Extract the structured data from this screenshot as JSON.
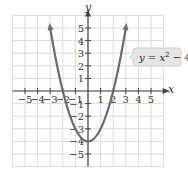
{
  "chart_data": {
    "type": "line",
    "title": "",
    "function": "y = x^2 - 4",
    "xlabel": "x",
    "ylabel": "y",
    "xlim": [
      -6,
      6
    ],
    "ylim": [
      -6,
      6
    ],
    "grid": true,
    "x_ticks": [
      -5,
      -4,
      -3,
      -2,
      -1,
      1,
      2,
      3,
      4,
      5
    ],
    "y_ticks": [
      5,
      4,
      3,
      2,
      1,
      -1,
      -2,
      -3,
      -4,
      -5
    ],
    "series": [
      {
        "name": "y = x² − 4",
        "x": [
          -3,
          -2.5,
          -2,
          -1.5,
          -1,
          -0.5,
          0,
          0.5,
          1,
          1.5,
          2,
          2.5,
          3
        ],
        "y": [
          5,
          2.25,
          0,
          -1.75,
          -3,
          -3.75,
          -4,
          -3.75,
          -3,
          -1.75,
          0,
          2.25,
          5
        ],
        "color": "#6b6b6b"
      }
    ],
    "annotations": [
      {
        "text": "y = x² − 4",
        "position": "right, near (3.5, 3)"
      }
    ],
    "key_points": {
      "vertex": [
        0,
        -4
      ],
      "x_intercepts": [
        [
          -2,
          0
        ],
        [
          2,
          0
        ]
      ]
    }
  },
  "labels": {
    "x_axis": "x",
    "y_axis": "y",
    "equation": {
      "lhs": "y",
      "eq": " = ",
      "var": "x",
      "exp": "2",
      "rest": " − 4"
    },
    "x_ticks": [
      "−5",
      "−4",
      "−3",
      "−2",
      "−1",
      "1",
      "2",
      "3",
      "4",
      "5"
    ],
    "y_ticks": [
      "5",
      "4",
      "3",
      "2",
      "1",
      "−1",
      "−2",
      "−3",
      "−4",
      "−5"
    ]
  },
  "colors": {
    "grid": "#dcdcdc",
    "axis": "#444444",
    "curve": "#6b6b6b",
    "label_box": "#e6e6e6",
    "label_border": "#c8c8c8"
  }
}
